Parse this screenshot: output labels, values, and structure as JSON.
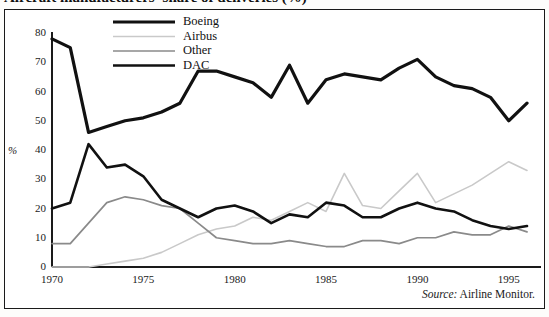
{
  "figure": {
    "title": "Aircraft manufacturers' share of deliveries (%)",
    "source_prefix": "Source:",
    "source_text": "Airline Monitor."
  },
  "axes": {
    "ylabel": "%",
    "yticks": [
      "0",
      "10",
      "20",
      "30",
      "40",
      "50",
      "60",
      "70",
      "80"
    ],
    "xticks": [
      "1970",
      "1975",
      "1980",
      "1985",
      "1990",
      "1995"
    ]
  },
  "legend": {
    "position": "top-center",
    "items": [
      {
        "label": "Boeing",
        "color": "#111111",
        "width": 3.2
      },
      {
        "label": "Airbus",
        "color": "#c9c9c9",
        "width": 1.6
      },
      {
        "label": "Other",
        "color": "#8a8a8a",
        "width": 1.7
      },
      {
        "label": "DAC",
        "color": "#111111",
        "width": 2.6
      }
    ]
  },
  "chart_data": {
    "type": "line",
    "title": "Aircraft manufacturers' share of deliveries (%)",
    "xlabel": "",
    "ylabel": "%",
    "xlim": [
      1970,
      1996
    ],
    "ylim": [
      0,
      80
    ],
    "grid": false,
    "legend_position": "top-center",
    "x": [
      1970,
      1971,
      1972,
      1973,
      1974,
      1975,
      1976,
      1977,
      1978,
      1979,
      1980,
      1981,
      1982,
      1983,
      1984,
      1985,
      1986,
      1987,
      1988,
      1989,
      1990,
      1991,
      1992,
      1993,
      1994,
      1995,
      1996
    ],
    "series": [
      {
        "name": "Boeing",
        "color": "#111111",
        "width": 3.2,
        "values": [
          78,
          75,
          46,
          48,
          50,
          51,
          53,
          56,
          67,
          67,
          65,
          63,
          58,
          69,
          56,
          64,
          66,
          65,
          64,
          68,
          71,
          65,
          62,
          61,
          58,
          50,
          56
        ]
      },
      {
        "name": "Airbus",
        "color": "#c9c9c9",
        "width": 1.6,
        "values": [
          0,
          0,
          0,
          1,
          2,
          3,
          5,
          8,
          11,
          13,
          14,
          17,
          16,
          19,
          22,
          19,
          32,
          21,
          20,
          26,
          32,
          22,
          25,
          28,
          32,
          36,
          33
        ]
      },
      {
        "name": "Other",
        "color": "#8a8a8a",
        "width": 1.7,
        "values": [
          8,
          8,
          15,
          22,
          24,
          23,
          21,
          20,
          15,
          10,
          9,
          8,
          8,
          9,
          8,
          7,
          7,
          9,
          9,
          8,
          10,
          10,
          12,
          11,
          11,
          14,
          12
        ]
      },
      {
        "name": "DAC",
        "color": "#111111",
        "width": 2.6,
        "values": [
          20,
          22,
          42,
          34,
          35,
          31,
          23,
          20,
          17,
          20,
          21,
          19,
          15,
          18,
          17,
          22,
          21,
          17,
          17,
          20,
          22,
          20,
          19,
          16,
          14,
          13,
          14
        ]
      }
    ]
  }
}
